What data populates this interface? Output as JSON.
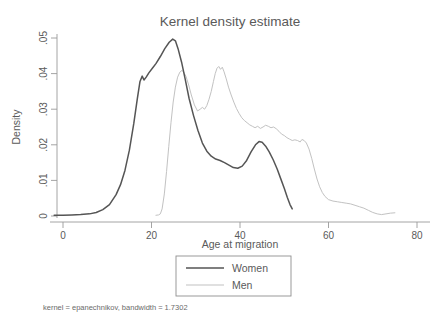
{
  "chart_data": {
    "type": "line",
    "title": "Kernel density estimate",
    "xlabel": "Age at migration",
    "ylabel": "Density",
    "note": "kernel = epanechnikov, bandwidth = 1.7302",
    "xlim": [
      -3,
      81
    ],
    "ylim": [
      -0.0015,
      0.053
    ],
    "xticks": [
      0,
      20,
      40,
      60,
      80
    ],
    "xticklabels": [
      "0",
      "20",
      "40",
      "60",
      "80"
    ],
    "yticks": [
      0,
      0.01,
      0.02,
      0.03,
      0.04,
      0.05
    ],
    "yticklabels": [
      "0",
      ".01",
      ".02",
      ".03",
      ".04",
      ".05"
    ],
    "grid": false,
    "legend_position": "below-axis-center",
    "legend": [
      {
        "name": "Women",
        "color": "#555555",
        "width": 1.5
      },
      {
        "name": "Men",
        "color": "#c2c2c2",
        "width": 1.0
      }
    ],
    "series": [
      {
        "name": "Women",
        "color": "#555555",
        "points": [
          [
            -2.0,
            0.0002
          ],
          [
            0.0,
            0.0002
          ],
          [
            2.0,
            0.0003
          ],
          [
            4.0,
            0.0004
          ],
          [
            6.0,
            0.0006
          ],
          [
            7.5,
            0.001
          ],
          [
            9.0,
            0.0018
          ],
          [
            10.5,
            0.0032
          ],
          [
            12.0,
            0.006
          ],
          [
            13.0,
            0.0088
          ],
          [
            14.0,
            0.0128
          ],
          [
            15.0,
            0.0185
          ],
          [
            16.0,
            0.026
          ],
          [
            16.8,
            0.033
          ],
          [
            17.4,
            0.0378
          ],
          [
            17.9,
            0.0393
          ],
          [
            18.3,
            0.0382
          ],
          [
            18.8,
            0.039
          ],
          [
            19.4,
            0.0402
          ],
          [
            20.2,
            0.0415
          ],
          [
            21.0,
            0.0428
          ],
          [
            22.0,
            0.0448
          ],
          [
            23.0,
            0.047
          ],
          [
            24.0,
            0.0488
          ],
          [
            24.8,
            0.0497
          ],
          [
            25.4,
            0.0492
          ],
          [
            26.0,
            0.047
          ],
          [
            26.8,
            0.0432
          ],
          [
            27.6,
            0.0385
          ],
          [
            28.5,
            0.033
          ],
          [
            29.5,
            0.0282
          ],
          [
            30.5,
            0.024
          ],
          [
            31.5,
            0.0205
          ],
          [
            32.5,
            0.0182
          ],
          [
            33.5,
            0.0168
          ],
          [
            34.5,
            0.016
          ],
          [
            35.5,
            0.0156
          ],
          [
            36.5,
            0.015
          ],
          [
            37.5,
            0.0143
          ],
          [
            38.5,
            0.0136
          ],
          [
            39.5,
            0.0134
          ],
          [
            40.5,
            0.014
          ],
          [
            41.5,
            0.0156
          ],
          [
            42.5,
            0.018
          ],
          [
            43.5,
            0.02
          ],
          [
            44.3,
            0.0209
          ],
          [
            45.0,
            0.0207
          ],
          [
            45.8,
            0.0196
          ],
          [
            46.6,
            0.018
          ],
          [
            47.5,
            0.0158
          ],
          [
            48.4,
            0.0132
          ],
          [
            49.2,
            0.0105
          ],
          [
            50.0,
            0.0078
          ],
          [
            50.7,
            0.0052
          ],
          [
            51.3,
            0.0032
          ],
          [
            51.8,
            0.002
          ]
        ]
      },
      {
        "name": "Men",
        "color": "#c2c2c2",
        "points": [
          [
            21.0,
            0.0002
          ],
          [
            21.6,
            0.0003
          ],
          [
            22.0,
            0.0006
          ],
          [
            22.4,
            0.002
          ],
          [
            22.9,
            0.0062
          ],
          [
            23.4,
            0.0125
          ],
          [
            23.9,
            0.0195
          ],
          [
            24.4,
            0.0262
          ],
          [
            24.9,
            0.032
          ],
          [
            25.4,
            0.0362
          ],
          [
            25.9,
            0.039
          ],
          [
            26.4,
            0.0404
          ],
          [
            26.9,
            0.0409
          ],
          [
            27.3,
            0.0404
          ],
          [
            27.8,
            0.0392
          ],
          [
            28.4,
            0.0368
          ],
          [
            29.0,
            0.034
          ],
          [
            29.7,
            0.0312
          ],
          [
            30.4,
            0.0295
          ],
          [
            31.0,
            0.03
          ],
          [
            31.5,
            0.0305
          ],
          [
            32.0,
            0.03
          ],
          [
            32.5,
            0.031
          ],
          [
            33.0,
            0.0328
          ],
          [
            33.5,
            0.035
          ],
          [
            34.0,
            0.0378
          ],
          [
            34.4,
            0.04
          ],
          [
            34.8,
            0.0415
          ],
          [
            35.2,
            0.042
          ],
          [
            35.6,
            0.0412
          ],
          [
            36.0,
            0.0418
          ],
          [
            36.4,
            0.0405
          ],
          [
            36.9,
            0.0385
          ],
          [
            37.4,
            0.0362
          ],
          [
            38.0,
            0.034
          ],
          [
            38.6,
            0.032
          ],
          [
            39.2,
            0.0302
          ],
          [
            39.8,
            0.0288
          ],
          [
            40.4,
            0.0276
          ],
          [
            41.0,
            0.0268
          ],
          [
            41.6,
            0.0262
          ],
          [
            42.2,
            0.0256
          ],
          [
            42.8,
            0.0252
          ],
          [
            43.4,
            0.0248
          ],
          [
            44.0,
            0.0252
          ],
          [
            44.6,
            0.0246
          ],
          [
            45.2,
            0.025
          ],
          [
            45.8,
            0.0255
          ],
          [
            46.4,
            0.0252
          ],
          [
            47.0,
            0.0248
          ],
          [
            47.6,
            0.025
          ],
          [
            48.2,
            0.0245
          ],
          [
            48.8,
            0.0238
          ],
          [
            49.4,
            0.023
          ],
          [
            50.0,
            0.0226
          ],
          [
            50.6,
            0.022
          ],
          [
            51.2,
            0.0216
          ],
          [
            51.8,
            0.0212
          ],
          [
            52.4,
            0.0214
          ],
          [
            53.0,
            0.0212
          ],
          [
            53.6,
            0.0208
          ],
          [
            54.0,
            0.0215
          ],
          [
            54.5,
            0.0212
          ],
          [
            55.0,
            0.0205
          ],
          [
            55.6,
            0.0188
          ],
          [
            56.2,
            0.0162
          ],
          [
            56.8,
            0.0132
          ],
          [
            57.4,
            0.0104
          ],
          [
            58.0,
            0.0082
          ],
          [
            58.6,
            0.0066
          ],
          [
            59.2,
            0.0055
          ],
          [
            60.0,
            0.0046
          ],
          [
            61.0,
            0.0042
          ],
          [
            62.0,
            0.004
          ],
          [
            63.0,
            0.0038
          ],
          [
            64.0,
            0.0036
          ],
          [
            65.0,
            0.0034
          ],
          [
            66.0,
            0.003
          ],
          [
            67.0,
            0.0026
          ],
          [
            68.0,
            0.0022
          ],
          [
            69.0,
            0.0016
          ],
          [
            70.0,
            0.001
          ],
          [
            71.0,
            0.0006
          ],
          [
            72.0,
            0.0004
          ],
          [
            73.0,
            0.0006
          ],
          [
            74.0,
            0.0008
          ],
          [
            75.0,
            0.0009
          ]
        ]
      }
    ]
  }
}
